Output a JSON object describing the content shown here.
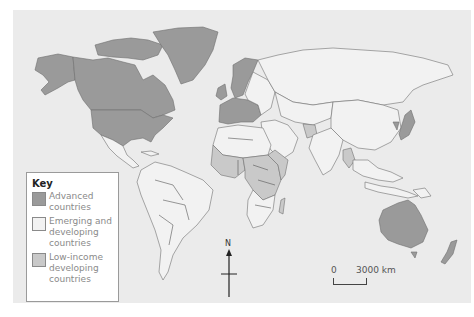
{
  "map": {
    "title": "World map of advanced, emerging and developing, and low-income developing countries",
    "colors": {
      "ocean": "#ebebeb",
      "advanced": "#9a9a9a",
      "emerging": "#f2f2f2",
      "low_income": "#c9c9c9"
    }
  },
  "key": {
    "title": "Key",
    "items": [
      {
        "label_line1": "Advanced",
        "label_line2": "countries",
        "label_line3": "",
        "color": "#9a9a9a"
      },
      {
        "label_line1": "Emerging and",
        "label_line2": "developing",
        "label_line3": "countries",
        "color": "#f2f2f2"
      },
      {
        "label_line1": "Low-income",
        "label_line2": "developing",
        "label_line3": "countries",
        "color": "#c9c9c9"
      }
    ]
  },
  "compass": {
    "label": "N"
  },
  "scale_bar": {
    "start": "0",
    "end": "3000 km"
  }
}
